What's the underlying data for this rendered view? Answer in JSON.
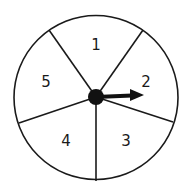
{
  "spinner": {
    "sections": [
      {
        "label": "1"
      },
      {
        "label": "2"
      },
      {
        "label": "3"
      },
      {
        "label": "4"
      },
      {
        "label": "5"
      }
    ],
    "pointer": {
      "points_to": "2"
    },
    "colors": {
      "stroke": "#1a1a1a",
      "fill": "#ffffff"
    }
  }
}
